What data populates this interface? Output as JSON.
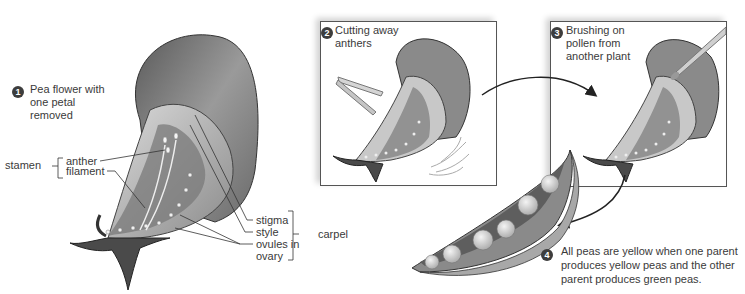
{
  "figure": {
    "colors": {
      "ink": "#3a3a3a",
      "badge": "#3d3d3d",
      "panel_border": "#555555",
      "petal_dark": "#4a4a4a",
      "petal_light": "#bdbdbd"
    },
    "step1": {
      "number": "1",
      "caption_line1": "Pea flower with",
      "caption_line2": "one petal",
      "caption_line3": "removed",
      "labels": {
        "stamen": "stamen",
        "anther": "anther",
        "filament": "filament",
        "stigma": "stigma",
        "style": "style",
        "ovules_line1": "ovules in",
        "ovules_line2": "ovary",
        "carpel": "carpel"
      }
    },
    "step2": {
      "number": "2",
      "caption_line1": "Cutting away",
      "caption_line2": "anthers"
    },
    "step3": {
      "number": "3",
      "caption_line1": "Brushing on",
      "caption_line2": "pollen from",
      "caption_line3": "another plant"
    },
    "step4": {
      "number": "4",
      "caption_line1": "All peas are yellow when one parent",
      "caption_line2": "produces yellow peas and the other",
      "caption_line3": "parent produces green peas."
    }
  }
}
